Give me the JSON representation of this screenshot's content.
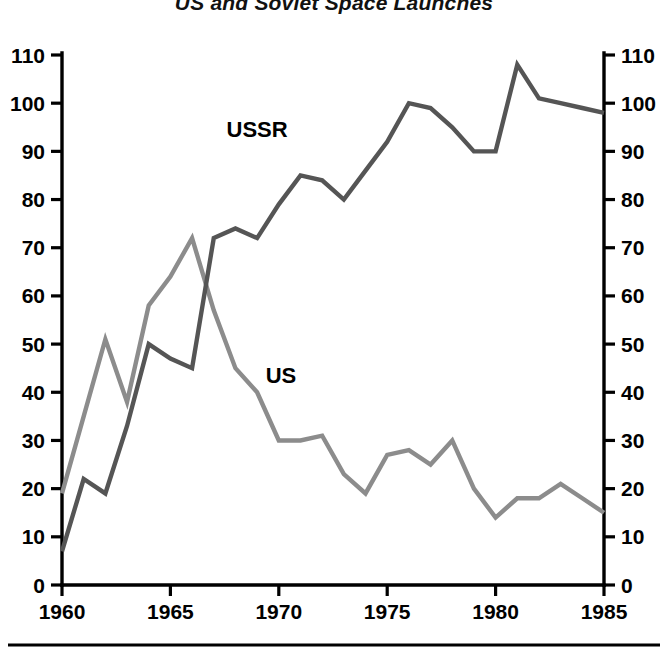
{
  "chart_data": {
    "type": "line",
    "title": "US and Soviet Space Launches",
    "xlabel": "",
    "ylabel": "",
    "xlim": [
      1960,
      1985
    ],
    "ylim": [
      0,
      110
    ],
    "xticks": [
      1960,
      1965,
      1970,
      1975,
      1980,
      1985
    ],
    "yticks": [
      0,
      10,
      20,
      30,
      40,
      50,
      60,
      70,
      80,
      90,
      100,
      110
    ],
    "ytick_labels_left": [
      "0",
      "10",
      "20",
      "30",
      "40",
      "50",
      "60",
      "70",
      "80",
      "90",
      "100",
      "110"
    ],
    "ytick_labels_right": [
      "0",
      "10",
      "20",
      "30",
      "40",
      "50",
      "60",
      "70",
      "80",
      "90",
      "100",
      "110"
    ],
    "xtick_labels": [
      "1960",
      "1965",
      "1970",
      "1975",
      "1980",
      "1985"
    ],
    "grid": false,
    "legend": "inline-labels",
    "x": [
      1960,
      1961,
      1962,
      1963,
      1964,
      1965,
      1966,
      1967,
      1968,
      1969,
      1970,
      1971,
      1972,
      1973,
      1974,
      1975,
      1976,
      1977,
      1978,
      1979,
      1980,
      1981,
      1982,
      1983,
      1984,
      1985
    ],
    "series": [
      {
        "name": "US",
        "color": "#8c8c8c",
        "label": "US",
        "label_x": 1970.1,
        "label_y": 42,
        "values": [
          19,
          35,
          51,
          38,
          58,
          64,
          72,
          57,
          45,
          40,
          30,
          30,
          31,
          23,
          19,
          27,
          28,
          25,
          30,
          20,
          14,
          18,
          18,
          21,
          18,
          15
        ]
      },
      {
        "name": "USSR",
        "color": "#555555",
        "label": "USSR",
        "label_x": 1969.0,
        "label_y": 93,
        "values": [
          7,
          22,
          19,
          33,
          50,
          47,
          45,
          72,
          74,
          72,
          79,
          85,
          84,
          80,
          86,
          92,
          100,
          99,
          95,
          90,
          90,
          108,
          101,
          100,
          99,
          98
        ]
      }
    ],
    "axis_color": "#000000",
    "background_color": "#ffffff"
  },
  "layout": {
    "plot_left_px": 62,
    "plot_right_px": 604,
    "plot_top_px": 55,
    "plot_bottom_px": 585,
    "bottom_rule_y_px": 645
  }
}
